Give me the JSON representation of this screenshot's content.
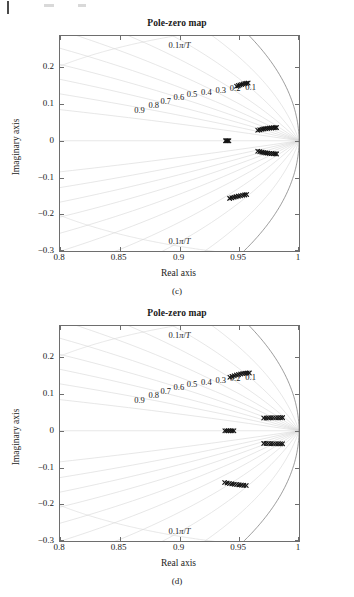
{
  "page": {
    "background": "#ffffff",
    "axis_color": "#6e6e6e",
    "grid_color": "#d7d7d7",
    "marker_color": "#141414"
  },
  "figures": [
    {
      "id": "c",
      "title": "Pole-zero map",
      "subcaption": "(c)",
      "xaxis": {
        "label": "Real axis",
        "min": 0.8,
        "max": 1.0,
        "ticks": [
          0.8,
          0.85,
          0.9,
          0.95,
          1.0
        ],
        "tick_labels": [
          "0.8",
          "0.85",
          "0.9",
          "0.95",
          "1"
        ]
      },
      "yaxis": {
        "label": "Imaginary axis",
        "min": -0.3,
        "max": 0.285,
        "ticks": [
          0.2,
          0.1,
          0.0,
          -0.1,
          -0.2,
          -0.3
        ],
        "tick_labels": [
          "0.2",
          "0.1",
          "0",
          "−0.1",
          "−0.2",
          "−0.3"
        ]
      },
      "grid": {
        "type": "z-plane",
        "damping_labels": [
          "0.9",
          "0.8",
          "0.7",
          "0.6",
          "0.5",
          "0.4",
          "0.3",
          "0.2",
          "0.1"
        ],
        "frequency_label_top": "0.1π/T",
        "frequency_label_bottom": "0.1π/T",
        "unit_circle": true
      },
      "chart_data": {
        "type": "scatter",
        "title": "Pole-zero map",
        "xlabel": "Real axis",
        "ylabel": "Imaginary axis",
        "xlim": [
          0.8,
          1.0
        ],
        "ylim": [
          -0.3,
          0.285
        ],
        "grid": true,
        "legend": "none",
        "annotations": [
          {
            "text": "0.1π/T",
            "x": 0.9,
            "y": 0.262
          },
          {
            "text": "0.1π/T",
            "x": 0.9,
            "y": -0.272
          },
          {
            "text": "0.9",
            "x": 0.8665,
            "y": 0.083
          },
          {
            "text": "0.8",
            "x": 0.8785,
            "y": 0.098
          },
          {
            "text": "0.7",
            "x": 0.8885,
            "y": 0.109
          },
          {
            "text": "0.6",
            "x": 0.8995,
            "y": 0.119
          },
          {
            "text": "0.5",
            "x": 0.9105,
            "y": 0.128
          },
          {
            "text": "0.4",
            "x": 0.9225,
            "y": 0.134
          },
          {
            "text": "0.3",
            "x": 0.9345,
            "y": 0.139
          },
          {
            "text": "0.2",
            "x": 0.9465,
            "y": 0.144
          },
          {
            "text": "0.1",
            "x": 0.9595,
            "y": 0.147
          }
        ],
        "series": [
          {
            "name": "pole-locus-upper-branch",
            "marker": "x",
            "points": [
              [
                0.9655,
                0.0285
              ],
              [
                0.9672,
                0.0297
              ],
              [
                0.969,
                0.031
              ],
              [
                0.9706,
                0.0322
              ],
              [
                0.9722,
                0.0331
              ],
              [
                0.9738,
                0.0338
              ],
              [
                0.9754,
                0.0344
              ],
              [
                0.977,
                0.0349
              ],
              [
                0.9786,
                0.0353
              ],
              [
                0.98,
                0.0356
              ],
              [
                0.9812,
                0.0358
              ]
            ]
          },
          {
            "name": "pole-locus-lower-branch",
            "marker": "x",
            "points": [
              [
                0.9655,
                -0.0285
              ],
              [
                0.9672,
                -0.0297
              ],
              [
                0.969,
                -0.031
              ],
              [
                0.9706,
                -0.0322
              ],
              [
                0.9722,
                -0.0331
              ],
              [
                0.9738,
                -0.0338
              ],
              [
                0.9754,
                -0.0344
              ],
              [
                0.977,
                -0.0349
              ],
              [
                0.9786,
                -0.0353
              ],
              [
                0.98,
                -0.0356
              ],
              [
                0.9812,
                -0.0358
              ]
            ]
          },
          {
            "name": "pole-locus-real-axis",
            "marker": "x",
            "points": [
              [
                0.9385,
                0.0
              ],
              [
                0.9392,
                0.0
              ],
              [
                0.9399,
                0.0
              ],
              [
                0.9406,
                0.0
              ],
              [
                0.9413,
                0.0
              ]
            ]
          },
          {
            "name": "pole-locus-upper-high-frequency",
            "marker": "x",
            "points": [
              [
                0.9478,
                0.1482
              ],
              [
                0.9492,
                0.15
              ],
              [
                0.9506,
                0.1517
              ],
              [
                0.952,
                0.1532
              ],
              [
                0.9534,
                0.1545
              ],
              [
                0.9548,
                0.1556
              ],
              [
                0.9561,
                0.1565
              ],
              [
                0.9574,
                0.1572
              ]
            ]
          },
          {
            "name": "pole-locus-lower-high-frequency",
            "marker": "x",
            "points": [
              [
                0.942,
                -0.1568
              ],
              [
                0.9438,
                -0.1553
              ],
              [
                0.9456,
                -0.1538
              ],
              [
                0.9474,
                -0.1522
              ],
              [
                0.9492,
                -0.1508
              ],
              [
                0.951,
                -0.1495
              ],
              [
                0.9528,
                -0.1483
              ],
              [
                0.9546,
                -0.1473
              ],
              [
                0.9562,
                -0.1464
              ]
            ]
          }
        ]
      }
    },
    {
      "id": "d",
      "title": "Pole-zero map",
      "subcaption": "(d)",
      "xaxis": {
        "label": "Real axis",
        "min": 0.8,
        "max": 1.0,
        "ticks": [
          0.8,
          0.85,
          0.9,
          0.95,
          1.0
        ],
        "tick_labels": [
          "0.8",
          "0.85",
          "0.9",
          "0.95",
          "1"
        ]
      },
      "yaxis": {
        "label": "Imaginary axis",
        "min": -0.3,
        "max": 0.285,
        "ticks": [
          0.2,
          0.1,
          0.0,
          -0.1,
          -0.2,
          -0.3
        ],
        "tick_labels": [
          "0.2",
          "0.1",
          "0",
          "−0.1",
          "−0.2",
          "−0.3"
        ]
      },
      "grid": {
        "type": "z-plane",
        "damping_labels": [
          "0.9",
          "0.8",
          "0.7",
          "0.6",
          "0.5",
          "0.4",
          "0.3",
          "0.2",
          "0.1"
        ],
        "frequency_label_top": "0.1π/T",
        "frequency_label_bottom": "0.1π/T",
        "unit_circle": true
      },
      "chart_data": {
        "type": "scatter",
        "title": "Pole-zero map",
        "xlabel": "Real axis",
        "ylabel": "Imaginary axis",
        "xlim": [
          0.8,
          1.0
        ],
        "ylim": [
          -0.3,
          0.285
        ],
        "grid": true,
        "legend": "none",
        "annotations": [
          {
            "text": "0.1π/T",
            "x": 0.9,
            "y": 0.262
          },
          {
            "text": "0.1π/T",
            "x": 0.9,
            "y": -0.272
          },
          {
            "text": "0.9",
            "x": 0.8665,
            "y": 0.083
          },
          {
            "text": "0.8",
            "x": 0.8785,
            "y": 0.098
          },
          {
            "text": "0.7",
            "x": 0.8885,
            "y": 0.109
          },
          {
            "text": "0.6",
            "x": 0.8995,
            "y": 0.119
          },
          {
            "text": "0.5",
            "x": 0.9105,
            "y": 0.128
          },
          {
            "text": "0.4",
            "x": 0.9225,
            "y": 0.134
          },
          {
            "text": "0.3",
            "x": 0.9345,
            "y": 0.139
          },
          {
            "text": "0.2",
            "x": 0.9465,
            "y": 0.144
          },
          {
            "text": "0.1",
            "x": 0.9595,
            "y": 0.147
          }
        ],
        "series": [
          {
            "name": "pole-locus-upper-branch",
            "marker": "x",
            "points": [
              [
                0.9705,
                0.0345
              ],
              [
                0.9725,
                0.0348
              ],
              [
                0.9745,
                0.035
              ],
              [
                0.9765,
                0.0352
              ],
              [
                0.9785,
                0.0353
              ],
              [
                0.9805,
                0.0354
              ],
              [
                0.9825,
                0.0355
              ],
              [
                0.9845,
                0.0356
              ],
              [
                0.9862,
                0.0357
              ]
            ]
          },
          {
            "name": "pole-locus-lower-branch",
            "marker": "x",
            "points": [
              [
                0.9705,
                -0.0345
              ],
              [
                0.9725,
                -0.0348
              ],
              [
                0.9745,
                -0.035
              ],
              [
                0.9765,
                -0.0352
              ],
              [
                0.9785,
                -0.0353
              ],
              [
                0.9805,
                -0.0354
              ],
              [
                0.9825,
                -0.0355
              ],
              [
                0.9845,
                -0.0356
              ],
              [
                0.9862,
                -0.0357
              ]
            ]
          },
          {
            "name": "pole-locus-real-axis",
            "marker": "x",
            "points": [
              [
                0.938,
                0.0
              ],
              [
                0.9395,
                0.0
              ],
              [
                0.941,
                0.0
              ],
              [
                0.9425,
                0.0
              ],
              [
                0.944,
                0.0
              ],
              [
                0.9455,
                0.0
              ]
            ]
          },
          {
            "name": "pole-locus-upper-high-frequency",
            "marker": "x",
            "points": [
              [
                0.9422,
                0.1455
              ],
              [
                0.944,
                0.1478
              ],
              [
                0.9458,
                0.1498
              ],
              [
                0.9476,
                0.1516
              ],
              [
                0.9494,
                0.1532
              ],
              [
                0.9512,
                0.1545
              ],
              [
                0.953,
                0.1556
              ],
              [
                0.9548,
                0.1564
              ],
              [
                0.9566,
                0.157
              ],
              [
                0.9584,
                0.1574
              ]
            ]
          },
          {
            "name": "pole-locus-lower-high-frequency",
            "marker": "x",
            "points": [
              [
                0.9378,
                -0.141
              ],
              [
                0.9398,
                -0.1422
              ],
              [
                0.9418,
                -0.1434
              ],
              [
                0.9438,
                -0.1445
              ],
              [
                0.9458,
                -0.1455
              ],
              [
                0.9478,
                -0.1464
              ],
              [
                0.9498,
                -0.1472
              ],
              [
                0.9518,
                -0.1479
              ],
              [
                0.9538,
                -0.1485
              ],
              [
                0.9558,
                -0.149
              ]
            ]
          }
        ]
      }
    }
  ]
}
